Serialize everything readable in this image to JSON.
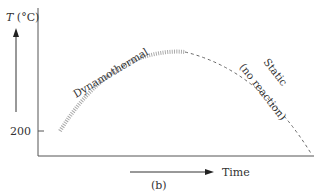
{
  "figure": {
    "y_axis_label_italic": "T",
    "y_axis_label_rest": " (°C)",
    "y_tick_label": "200",
    "x_axis_label": "Time",
    "caption": "(b)",
    "curve_labels": {
      "dynamothermal": "Dynamothermal",
      "static_line1": "Static",
      "static_line2": "(no reaction)"
    },
    "colors": {
      "axis": "#555555",
      "wavy": "#aaaaaa",
      "dashed": "#666666",
      "text": "#333333"
    }
  }
}
